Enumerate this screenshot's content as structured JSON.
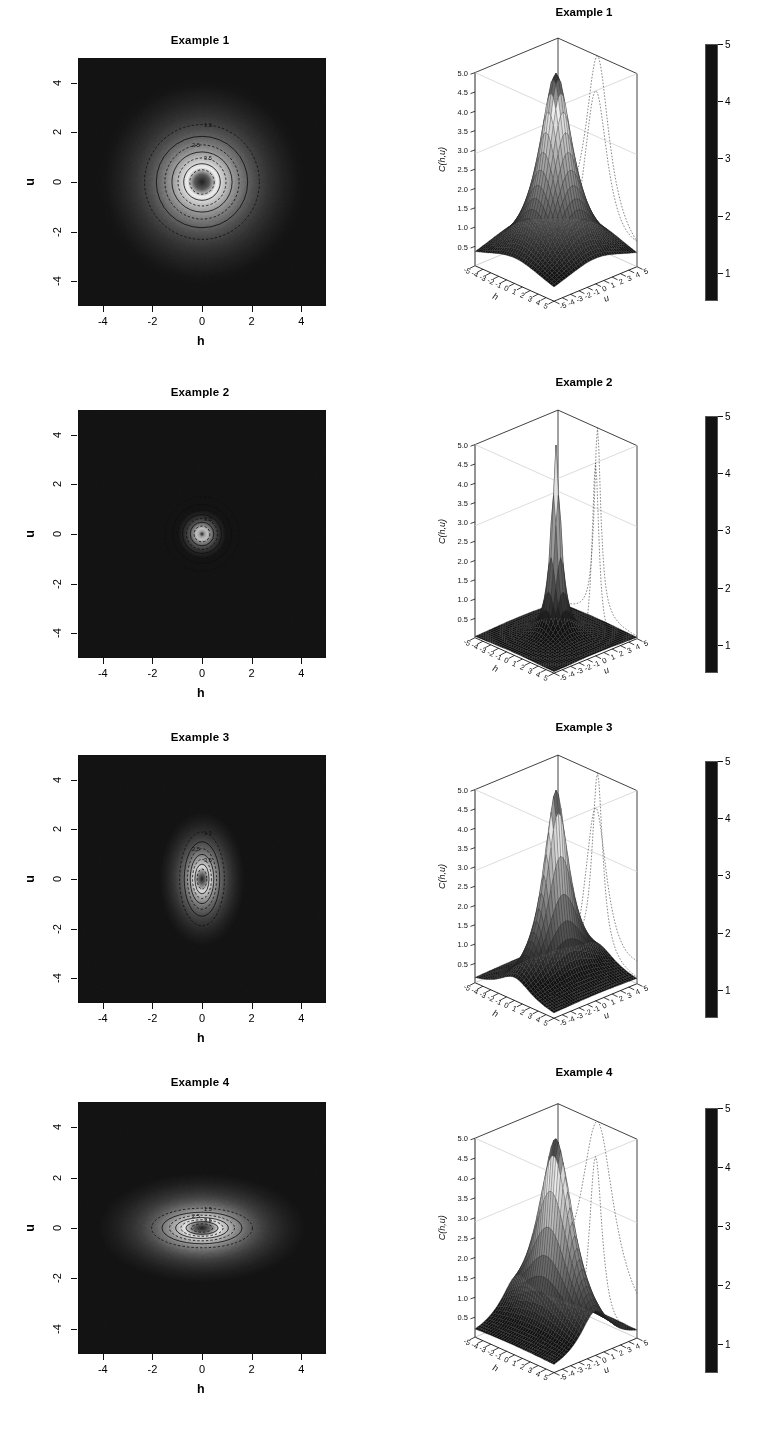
{
  "figure": {
    "axis_names": {
      "h": "h",
      "u": "u",
      "z": "C(h,u)"
    },
    "colors": {
      "background": "#ffffff",
      "ink": "#111111",
      "grid": "#b8b8b8",
      "cmap_low": "#151515",
      "cmap_mid": "#f2f2f2",
      "cmap_high": "#1b1b1b"
    }
  },
  "chart_data": {
    "type": "heatmap",
    "xlabel": "h",
    "ylabel": "u",
    "zlabel": "C(h,u)",
    "xlim": [
      -5,
      5
    ],
    "ylim": [
      -5,
      5
    ],
    "zlim": [
      0.5,
      5.0
    ],
    "grid": false,
    "legend_position": "right-colorbar",
    "contour_xticks": [
      "-4",
      "-2",
      "0",
      "2",
      "4"
    ],
    "contour_xtick_values": [
      -4,
      -2,
      0,
      2,
      4
    ],
    "contour_yticks": [
      "-4",
      "-2",
      "0",
      "2",
      "4"
    ],
    "contour_ytick_values": [
      -4,
      -2,
      0,
      2,
      4
    ],
    "persp_zticks": [
      "0.5",
      "1.0",
      "1.5",
      "2.0",
      "2.5",
      "3.0",
      "3.5",
      "4.0",
      "4.5",
      "5.0"
    ],
    "persp_ztick_values": [
      0.5,
      1.0,
      1.5,
      2.0,
      2.5,
      3.0,
      3.5,
      4.0,
      4.5,
      5.0
    ],
    "persp_hticks": [
      "-5",
      "-4",
      "-3",
      "-2",
      "-1",
      "0",
      "1",
      "2",
      "3",
      "4",
      "5"
    ],
    "persp_uticks": [
      "5",
      "4",
      "3",
      "2",
      "1",
      "0",
      "-1",
      "-2",
      "-3",
      "-4",
      "-5"
    ],
    "colorbar_ticks": [
      "1",
      "2",
      "3",
      "4",
      "5"
    ],
    "colorbar_tick_values": [
      1,
      2,
      3,
      4,
      5
    ],
    "colorbar_range": [
      0.5,
      5.0
    ],
    "contour_levels": [
      1.5,
      2.0,
      2.5,
      3.0,
      3.5,
      4.0,
      4.5
    ],
    "panels": [
      {
        "id": "example-1",
        "title": "Example 1",
        "scale_h": 1.0,
        "scale_u": 1.0,
        "peak": 5.0,
        "sharpness": 1.0,
        "contour_labels": [
          "1.5",
          "2.5",
          "3.5"
        ],
        "description": "Isotropic: roughly circular contours, broad symmetric peak"
      },
      {
        "id": "example-2",
        "title": "Example 2",
        "scale_h": 0.42,
        "scale_u": 0.42,
        "peak": 5.0,
        "sharpness": 2.4,
        "contour_labels": [
          "1.5",
          "2.5",
          "3.5"
        ],
        "description": "Isotropic but tightly concentrated: small circular contours, very sharp narrow peak"
      },
      {
        "id": "example-3",
        "title": "Example 3",
        "scale_h": 0.55,
        "scale_u": 1.15,
        "peak": 5.0,
        "sharpness": 1.5,
        "contour_labels": [
          "1.5",
          "2.5",
          "3.5"
        ],
        "description": "Anisotropic, elongated along u (vertical ellipses)"
      },
      {
        "id": "example-4",
        "title": "Example 4",
        "scale_h": 1.6,
        "scale_u": 0.62,
        "peak": 5.0,
        "sharpness": 1.3,
        "contour_labels": [
          "1.5",
          "2.5",
          "3.5"
        ],
        "description": "Anisotropic, elongated along h (horizontal ellipses)"
      }
    ]
  }
}
